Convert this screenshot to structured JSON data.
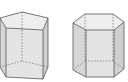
{
  "diagram": {
    "shapes": [
      {
        "name": "pentagonal-prism",
        "faces": 7,
        "visible_edges": "solid",
        "hidden_edges": "dashed"
      },
      {
        "name": "hexagonal-prism",
        "faces": 8,
        "visible_edges": "solid",
        "hidden_edges": "dashed"
      }
    ],
    "colors": {
      "edge": "#555555",
      "hidden_edge": "#777777",
      "top_face": "#eeeeee",
      "side_face_light": "#e2e2e2",
      "side_face_dark": "#cfcfcf"
    }
  }
}
